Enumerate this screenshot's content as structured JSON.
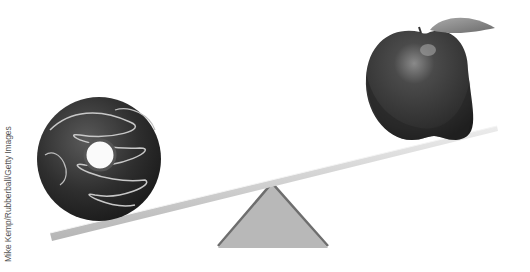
{
  "image": {
    "description": "Seesaw balancing a chocolate donut (low, left) against an apple (high, right)",
    "credit": "Mike Kemp/Rubberball/Getty Images"
  },
  "objects": {
    "left_item": "donut",
    "right_item": "apple",
    "fulcrum": "triangle"
  },
  "colors": {
    "background": "#ffffff",
    "plank": "#d6d6d6",
    "fulcrum": "#b8b8b8",
    "donut": "#2e2e2e",
    "apple": "#3a3a3a",
    "leaf": "#8a8a8a"
  }
}
